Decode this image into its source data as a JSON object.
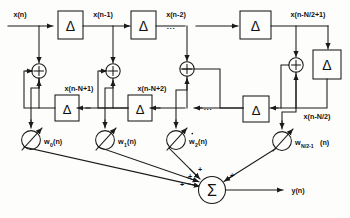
{
  "figure": {
    "type": "signal-flow-diagram",
    "title": ""
  },
  "signals": {
    "input_label": "x(n)",
    "output_label": "y(n)",
    "top_taps": [
      {
        "label": "x(n-1)"
      },
      {
        "label": "x(n-2)"
      },
      {
        "label": "x(n-N/2+1)"
      }
    ],
    "bottom_taps": [
      {
        "label": "x(n-N+1)"
      },
      {
        "label": "x(n-N+2)"
      },
      {
        "label": "x(n-N/2)"
      }
    ]
  },
  "blocks": {
    "delay_symbol": "Δ",
    "top_delays": 3,
    "bottom_delays": 3,
    "right_delay": 1
  },
  "adders": {
    "symbol": "+",
    "count": 3
  },
  "weights": [
    {
      "base": "w",
      "sub": "0",
      "arg": "(n)",
      "dot": false
    },
    {
      "base": "w",
      "sub": "1",
      "arg": "(n)",
      "dot": false
    },
    {
      "base": "w",
      "sub": "2",
      "arg": "(n)",
      "dot": true
    },
    {
      "base": "w",
      "sub": "N/2-1",
      "arg": "(n)",
      "dot": false
    }
  ],
  "summation": {
    "symbol": "Σ",
    "plus_signs": [
      "+",
      "+",
      "+",
      "+"
    ]
  },
  "ellipses": {
    "top": "...",
    "bottom": "..."
  },
  "colors": {
    "line": "#1a1a1a",
    "text": "#111111",
    "background": "#fdfdfc"
  }
}
